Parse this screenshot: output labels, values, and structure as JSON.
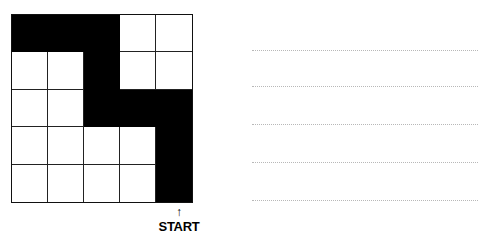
{
  "grid": {
    "rows": 5,
    "cols": 5,
    "cells": [
      [
        1,
        1,
        1,
        0,
        0
      ],
      [
        0,
        0,
        1,
        0,
        0
      ],
      [
        0,
        0,
        1,
        1,
        1
      ],
      [
        0,
        0,
        0,
        0,
        1
      ],
      [
        0,
        0,
        0,
        0,
        1
      ]
    ]
  },
  "start": {
    "label": "START",
    "arrow": "↑"
  },
  "answer_lines": {
    "count": 5
  }
}
